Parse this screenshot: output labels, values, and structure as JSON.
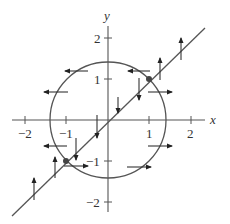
{
  "diagram": {
    "type": "phase-plane",
    "axes": {
      "x_label": "x",
      "y_label": "y",
      "x_ticks": [
        {
          "value": -2,
          "label": "−2"
        },
        {
          "value": -1,
          "label": "−1"
        },
        {
          "value": 1,
          "label": "1"
        },
        {
          "value": 2,
          "label": "2"
        }
      ],
      "y_ticks": [
        {
          "value": 2,
          "label": "2"
        },
        {
          "value": 1,
          "label": "1"
        },
        {
          "value": -1,
          "label": "−1"
        },
        {
          "value": -2,
          "label": "−2"
        }
      ]
    },
    "curves": [
      {
        "name": "circle",
        "equation": "x^2 + y^2 = 2",
        "radius": 1.414
      },
      {
        "name": "line",
        "equation": "y = x"
      }
    ],
    "equilibrium_points": [
      {
        "x": 1,
        "y": 1
      },
      {
        "x": -1,
        "y": -1
      }
    ],
    "vectors": [
      {
        "x": -0.85,
        "y": 1.15,
        "dir": "left"
      },
      {
        "x": 0.95,
        "y": 1.15,
        "dir": "left"
      },
      {
        "x": -1.6,
        "y": 0.6,
        "dir": "left"
      },
      {
        "x": 1.5,
        "y": 0.6,
        "dir": "right"
      },
      {
        "x": 0.7,
        "y": 0.6,
        "dir": "down"
      },
      {
        "x": 0.25,
        "y": 0.2,
        "dir": "down"
      },
      {
        "x": -0.25,
        "y": -0.25,
        "dir": "down"
      },
      {
        "x": -0.7,
        "y": -0.6,
        "dir": "down"
      },
      {
        "x": 1.25,
        "y": 1.4,
        "dir": "up"
      },
      {
        "x": 1.8,
        "y": 2.0,
        "dir": "up"
      },
      {
        "x": -1.3,
        "y": -1.4,
        "dir": "up"
      },
      {
        "x": -1.8,
        "y": -2.0,
        "dir": "up"
      },
      {
        "x": -1.4,
        "y": -0.55,
        "dir": "left"
      },
      {
        "x": 1.5,
        "y": -0.6,
        "dir": "right"
      },
      {
        "x": 0.75,
        "y": -1.15,
        "dir": "right"
      },
      {
        "x": -0.9,
        "y": -1.15,
        "dir": "right"
      }
    ]
  }
}
